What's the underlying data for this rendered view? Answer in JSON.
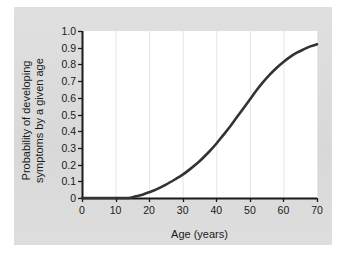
{
  "chart_data": {
    "type": "line",
    "title": "",
    "subtitle": "",
    "xlabel": "Age (years)",
    "ylabel": "Probability of developing symptoms by a given age",
    "ylabel_lines": [
      "Probability of developing",
      "symptoms by a given age"
    ],
    "xlim": [
      0,
      70
    ],
    "ylim": [
      0,
      1.0
    ],
    "xticks": [
      0,
      10,
      20,
      30,
      40,
      50,
      60,
      70
    ],
    "xtick_labels": [
      "0",
      "10",
      "20",
      "30",
      "40",
      "50",
      "60",
      "70"
    ],
    "yticks": [
      0,
      0.1,
      0.2,
      0.3,
      0.4,
      0.5,
      0.6,
      0.7,
      0.8,
      0.9,
      1.0
    ],
    "ytick_labels": [
      "0",
      "0.1",
      "0.2",
      "0.3",
      "0.4",
      "0.5",
      "0.6",
      "0.7",
      "0.8",
      "0.9",
      "1.0"
    ],
    "grid": "vertical-only",
    "gridline_x": [
      10,
      20,
      30,
      40,
      50,
      60,
      70
    ],
    "legend": "none",
    "annotations": [],
    "series": [
      {
        "name": "Cumulative probability of symptom onset",
        "color": "#333333",
        "line_width": 2.6,
        "x": [
          0,
          5,
          10,
          14,
          15,
          16,
          18,
          20,
          22,
          25,
          28,
          30,
          32,
          35,
          38,
          40,
          42,
          44,
          46,
          48,
          50,
          52,
          54,
          56,
          58,
          60,
          62,
          64,
          66,
          68,
          70
        ],
        "y": [
          0.0,
          0.0,
          0.0,
          0.0,
          0.005,
          0.01,
          0.02,
          0.035,
          0.05,
          0.08,
          0.115,
          0.14,
          0.17,
          0.22,
          0.28,
          0.325,
          0.375,
          0.425,
          0.48,
          0.535,
          0.59,
          0.645,
          0.695,
          0.74,
          0.78,
          0.815,
          0.845,
          0.87,
          0.89,
          0.908,
          0.92
        ]
      }
    ]
  },
  "figure": {
    "panel_color": "#dcdcdc",
    "plot_background": "#ffffff",
    "axis_color": "#1a1a1a",
    "gridline_color": "#e6e6e6",
    "curve_color": "#333333"
  }
}
